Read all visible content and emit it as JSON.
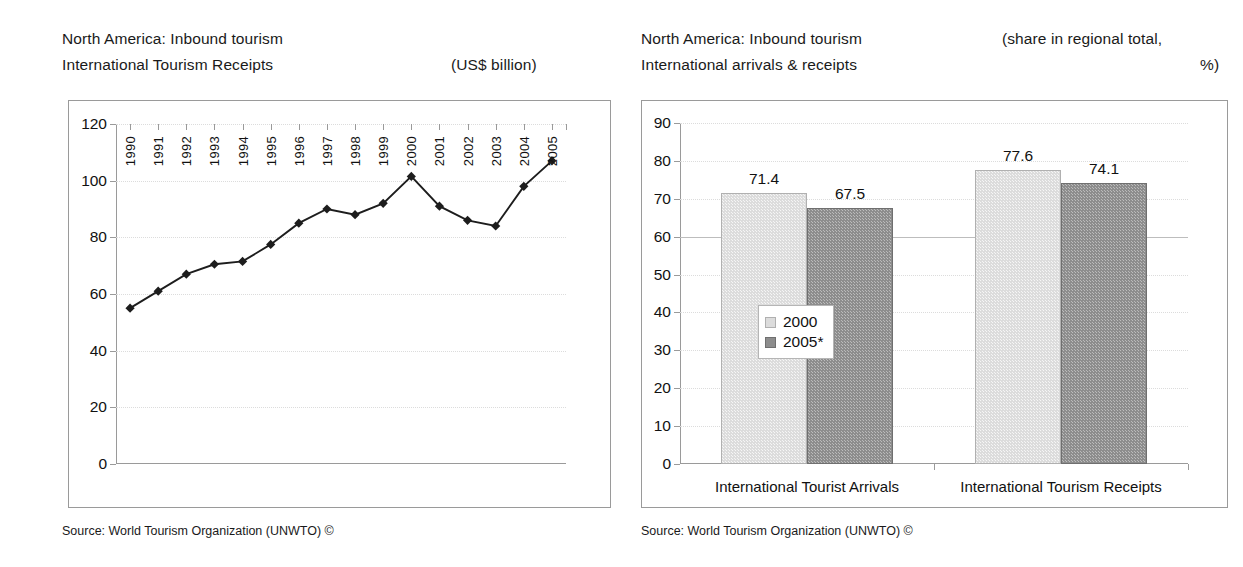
{
  "left_panel": {
    "header_line1": "North America: Inbound tourism",
    "header_line2": "International Tourism Receipts",
    "unit_note": "(US$ billion)",
    "source": "Source: World Tourism Organization (UNWTO) ©"
  },
  "right_panel": {
    "header_line1": "North America: Inbound tourism",
    "header_line2": "International arrivals & receipts",
    "unit_note_line1": "(share in regional total,",
    "unit_note_line2": "%)",
    "source": "Source: World Tourism Organization (UNWTO) ©"
  },
  "chart_data": [
    {
      "type": "line",
      "title": "North America: Inbound tourism — International Tourism Receipts",
      "xlabel": "",
      "ylabel": "",
      "unit": "US$ billion",
      "ylim": [
        0,
        120
      ],
      "yticks": [
        0,
        20,
        40,
        60,
        80,
        100,
        120
      ],
      "grid": true,
      "legend": "none",
      "marker": "diamond",
      "categories": [
        "1990",
        "1991",
        "1992",
        "1993",
        "1994",
        "1995",
        "1996",
        "1997",
        "1998",
        "1999",
        "2000",
        "2001",
        "2002",
        "2003",
        "2004",
        "2005"
      ],
      "values": [
        55,
        61,
        67,
        70.5,
        71.5,
        77.5,
        85,
        90,
        88,
        92,
        101.5,
        91,
        86,
        84,
        98,
        107
      ]
    },
    {
      "type": "bar",
      "title": "North America: Inbound tourism — International arrivals & receipts",
      "xlabel": "",
      "ylabel": "",
      "unit": "share in regional total, %",
      "ylim": [
        0,
        90
      ],
      "yticks": [
        0,
        10,
        20,
        30,
        40,
        50,
        60,
        70,
        80,
        90
      ],
      "grid": true,
      "legend": "inside-left",
      "categories": [
        "International Tourist Arrivals",
        "International Tourism Receipts"
      ],
      "series": [
        {
          "name": "2000",
          "values": [
            71.4,
            77.6
          ]
        },
        {
          "name": "2005*",
          "values": [
            67.5,
            74.1
          ]
        }
      ]
    }
  ]
}
